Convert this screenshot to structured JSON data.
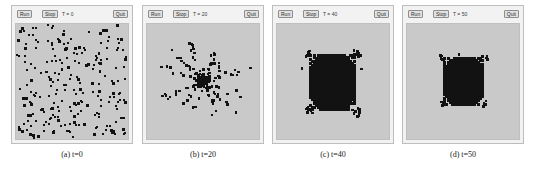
{
  "figure": {
    "panels": [
      {
        "id": "panel-a",
        "toolbar": {
          "run_label": "Run",
          "stop_label": "Stop",
          "quit_label": "Quit",
          "time_label": "T = 0"
        },
        "caption": "(a)  t=0",
        "canvas": {
          "background_color": "#c9c9c9",
          "particle_color": "#121212",
          "stage": "dispersed",
          "particle_count": 240
        }
      },
      {
        "id": "panel-b",
        "toolbar": {
          "run_label": "Run",
          "stop_label": "Stop",
          "quit_label": "Quit",
          "time_label": "T = 20"
        },
        "caption": "(b)  t=20",
        "canvas": {
          "background_color": "#c9c9c9",
          "particle_color": "#121212",
          "stage": "star-cluster",
          "particle_count": 240
        }
      },
      {
        "id": "panel-c",
        "toolbar": {
          "run_label": "Run",
          "stop_label": "Stop",
          "quit_label": "Quit",
          "time_label": "T = 40"
        },
        "caption": "(c)  t=40",
        "canvas": {
          "background_color": "#c9c9c9",
          "particle_color": "#121212",
          "stage": "dense-blob",
          "particle_count": 240
        }
      },
      {
        "id": "panel-d",
        "toolbar": {
          "run_label": "Run",
          "stop_label": "Stop",
          "quit_label": "Quit",
          "time_label": "T = 50"
        },
        "caption": "(d)  t=50",
        "canvas": {
          "background_color": "#c9c9c9",
          "particle_color": "#121212",
          "stage": "compact-blob",
          "particle_count": 240
        }
      }
    ]
  }
}
